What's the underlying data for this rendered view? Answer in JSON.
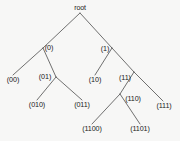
{
  "figure": {
    "background_color": "#f7f7f6",
    "edge_color": "#4d4d4d",
    "text_color": "#1a1a1a"
  },
  "nodes": [
    {
      "id": "root",
      "label": "root",
      "x": 80,
      "y": 8
    },
    {
      "id": "n0",
      "label": "(0)",
      "x": 49,
      "y": 48
    },
    {
      "id": "n1",
      "label": "(1)",
      "x": 105,
      "y": 49
    },
    {
      "id": "n00",
      "label": "(00)",
      "x": 13,
      "y": 80
    },
    {
      "id": "n01",
      "label": "(01)",
      "x": 45,
      "y": 77
    },
    {
      "id": "n10",
      "label": "(10)",
      "x": 95,
      "y": 80
    },
    {
      "id": "n11",
      "label": "(11)",
      "x": 125,
      "y": 78
    },
    {
      "id": "n010",
      "label": "(010)",
      "x": 37,
      "y": 105
    },
    {
      "id": "n011",
      "label": "(011)",
      "x": 82,
      "y": 105
    },
    {
      "id": "n110",
      "label": "(110)",
      "x": 133,
      "y": 99
    },
    {
      "id": "n111",
      "label": "(111)",
      "x": 164,
      "y": 106
    },
    {
      "id": "n1100",
      "label": "(1100)",
      "x": 92,
      "y": 129
    },
    {
      "id": "n1101",
      "label": "(1101)",
      "x": 140,
      "y": 129
    }
  ],
  "edges": [
    {
      "from": "root",
      "to": "n0",
      "x1": 80,
      "y1": 13,
      "x2": 43,
      "y2": 48
    },
    {
      "from": "root",
      "to": "n1",
      "x1": 80,
      "y1": 13,
      "x2": 112,
      "y2": 48
    },
    {
      "from": "n0",
      "to": "n00",
      "x1": 43,
      "y1": 48,
      "x2": 13,
      "y2": 75
    },
    {
      "from": "n0",
      "to": "n01",
      "x1": 43,
      "y1": 48,
      "x2": 56,
      "y2": 77
    },
    {
      "from": "n01",
      "to": "n010",
      "x1": 56,
      "y1": 77,
      "x2": 37,
      "y2": 100
    },
    {
      "from": "n01",
      "to": "n011",
      "x1": 56,
      "y1": 77,
      "x2": 82,
      "y2": 100
    },
    {
      "from": "n1",
      "to": "n10",
      "x1": 112,
      "y1": 48,
      "x2": 95,
      "y2": 75
    },
    {
      "from": "n1",
      "to": "n11",
      "x1": 112,
      "y1": 48,
      "x2": 134,
      "y2": 72
    },
    {
      "from": "n11",
      "to": "n110",
      "x1": 134,
      "y1": 72,
      "x2": 120,
      "y2": 94
    },
    {
      "from": "n11",
      "to": "n111",
      "x1": 134,
      "y1": 72,
      "x2": 163,
      "y2": 101
    },
    {
      "from": "n110",
      "to": "n1100",
      "x1": 120,
      "y1": 94,
      "x2": 92,
      "y2": 124
    },
    {
      "from": "n110",
      "to": "n1101",
      "x1": 120,
      "y1": 94,
      "x2": 140,
      "y2": 124
    }
  ]
}
